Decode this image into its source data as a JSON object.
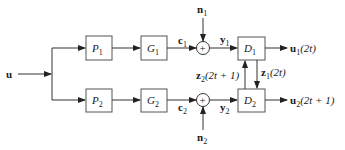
{
  "diagram": {
    "type": "block-diagram",
    "input": {
      "label": "u"
    },
    "branches": [
      {
        "blocks": [
          {
            "name": "P",
            "sub": "1"
          },
          {
            "name": "G",
            "sub": "1"
          }
        ],
        "signal_after_G": {
          "name": "c",
          "sub": "1"
        },
        "noise": {
          "name": "n",
          "sub": "1"
        },
        "sum_symbol": "+",
        "signal_after_sum": {
          "name": "y",
          "sub": "1"
        },
        "decoder": {
          "name": "D",
          "sub": "1"
        },
        "output": {
          "name": "u",
          "sub": "1",
          "arg": "(2t)"
        }
      },
      {
        "blocks": [
          {
            "name": "P",
            "sub": "2"
          },
          {
            "name": "G",
            "sub": "2"
          }
        ],
        "signal_after_G": {
          "name": "c",
          "sub": "2"
        },
        "noise": {
          "name": "n",
          "sub": "2"
        },
        "sum_symbol": "+",
        "signal_after_sum": {
          "name": "y",
          "sub": "2"
        },
        "decoder": {
          "name": "D",
          "sub": "2"
        },
        "output": {
          "name": "u",
          "sub": "2",
          "arg": "(2t + 1)"
        }
      }
    ],
    "cross_links": [
      {
        "from": "D2",
        "to": "D1",
        "name": "z",
        "sub": "2",
        "arg": "(2t + 1)"
      },
      {
        "from": "D1",
        "to": "D2",
        "name": "z",
        "sub": "1",
        "arg": "(2t)"
      }
    ]
  }
}
